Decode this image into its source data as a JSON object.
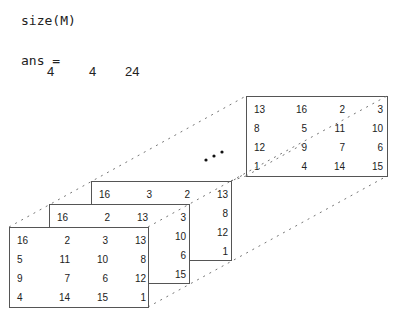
{
  "command": "size(M)",
  "output_label": "ans =",
  "output_values": [
    "4",
    "4",
    "24"
  ],
  "ellipsis": "...",
  "pages": {
    "front": [
      [
        "16",
        "2",
        "3",
        "13"
      ],
      [
        "5",
        "11",
        "10",
        "8"
      ],
      [
        "9",
        "7",
        "6",
        "12"
      ],
      [
        "4",
        "14",
        "15",
        "1"
      ]
    ],
    "second": [
      [
        "16",
        "2",
        "13",
        "3"
      ],
      [
        "",
        "",
        "",
        "10"
      ],
      [
        "",
        "",
        "",
        "6"
      ],
      [
        "",
        "",
        "",
        "15"
      ]
    ],
    "third": [
      [
        "16",
        "3",
        "2",
        "13"
      ],
      [
        "",
        "",
        "",
        "8"
      ],
      [
        "",
        "",
        "",
        "12"
      ],
      [
        "",
        "",
        "",
        "1"
      ]
    ],
    "last": [
      [
        "13",
        "16",
        "2",
        "3"
      ],
      [
        "8",
        "5",
        "11",
        "10"
      ],
      [
        "12",
        "9",
        "7",
        "6"
      ],
      [
        "1",
        "4",
        "14",
        "15"
      ]
    ]
  }
}
